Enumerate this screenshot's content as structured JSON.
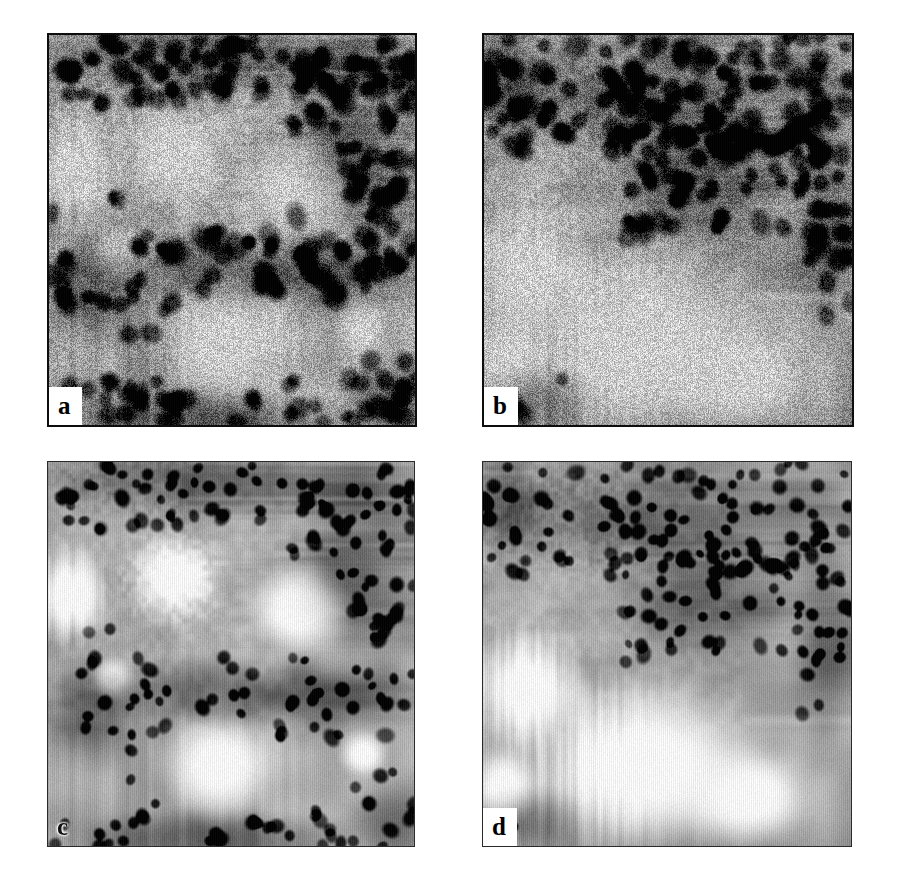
{
  "figure": {
    "caption": "",
    "background_color": "#ffffff",
    "layout": "2x2 grid of grayscale micrograph panels",
    "image_type": "grayscale histology micrograph"
  },
  "panels": [
    {
      "id": "a",
      "label": "a",
      "label_boxed": true,
      "row": 1,
      "column": 1,
      "x": 47,
      "y": 33,
      "width": 366,
      "height": 390,
      "border_style": "strong",
      "noise": "high",
      "description": "Noisy grayscale histology field: three large pale round vacuoles surrounded by dense dark nuclei; dark nuclei band across top and diagonal band through middle.",
      "mean_gray": "#a7a7a7",
      "light_blob_color": "#cfcfcf",
      "dark_nuclei_color": "#1b1b1b"
    },
    {
      "id": "b",
      "label": "b",
      "label_boxed": true,
      "row": 1,
      "column": 2,
      "x": 482,
      "y": 33,
      "width": 368,
      "height": 390,
      "border_style": "strong",
      "noise": "high",
      "description": "Noisy grayscale histology field, higher magnification: dense dark nuclei band across the upper third, large pale vacuole filling the lower two thirds.",
      "mean_gray": "#a2a2a2",
      "light_blob_color": "#c9c9c9",
      "dark_nuclei_color": "#141414"
    },
    {
      "id": "c",
      "label": "c",
      "label_boxed": false,
      "row": 2,
      "column": 1,
      "x": 47,
      "y": 461,
      "width": 366,
      "height": 384,
      "border_style": "light",
      "noise": "low",
      "description": "Denoised / smoothed version of panel a: crisp round dark nuclei and bright white vacuoles with smooth gradients.",
      "mean_gray": "#b9b9b9",
      "light_blob_color": "#fbfbfb",
      "dark_nuclei_color": "#101010"
    },
    {
      "id": "d",
      "label": "d",
      "label_boxed": true,
      "row": 2,
      "column": 2,
      "x": 482,
      "y": 461,
      "width": 368,
      "height": 384,
      "border_style": "light",
      "noise": "low",
      "description": "Denoised / smoothed version of panel b: crisp dark round nuclei across the top, large bright vacuole filling the lower portion.",
      "mean_gray": "#bdbdbd",
      "light_blob_color": "#fcfcfc",
      "dark_nuclei_color": "#0c0c0c"
    }
  ],
  "colors": {
    "page_background": "#ffffff",
    "panel_border": "#0d0d0d",
    "label_text": "#000000",
    "label_box": "#ffffff"
  }
}
